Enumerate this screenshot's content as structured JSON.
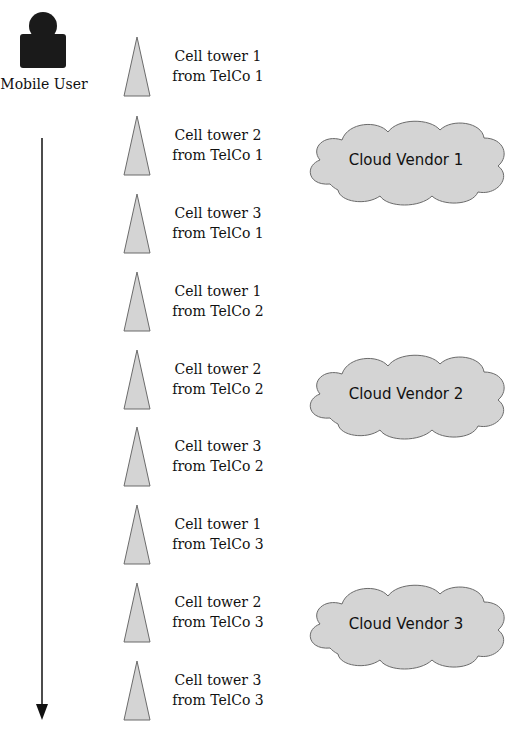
{
  "user": {
    "label": "Mobile User",
    "icon": "person-icon"
  },
  "journey_arrow": {
    "direction": "down"
  },
  "towers": [
    {
      "line1": "Cell tower 1",
      "line2": "from TelCo 1",
      "top": 36
    },
    {
      "line1": "Cell tower 2",
      "line2": "from TelCo 1",
      "top": 115
    },
    {
      "line1": "Cell tower 3",
      "line2": "from TelCo 1",
      "top": 193
    },
    {
      "line1": "Cell tower 1",
      "line2": "from TelCo 2",
      "top": 271
    },
    {
      "line1": "Cell tower 2",
      "line2": "from TelCo 2",
      "top": 349
    },
    {
      "line1": "Cell tower 3",
      "line2": "from TelCo 2",
      "top": 426
    },
    {
      "line1": "Cell tower 1",
      "line2": "from TelCo 3",
      "top": 504
    },
    {
      "line1": "Cell tower 2",
      "line2": "from TelCo 3",
      "top": 582
    },
    {
      "line1": "Cell tower 3",
      "line2": "from TelCo 3",
      "top": 660
    }
  ],
  "clouds": [
    {
      "label": "Cloud Vendor 1",
      "left": 300,
      "top": 114
    },
    {
      "label": "Cloud Vendor 2",
      "left": 300,
      "top": 348
    },
    {
      "label": "Cloud Vendor 3",
      "left": 300,
      "top": 578
    }
  ],
  "colors": {
    "fill": "#d4d4d4",
    "stroke": "#6b6b6b",
    "ink": "#111111"
  }
}
